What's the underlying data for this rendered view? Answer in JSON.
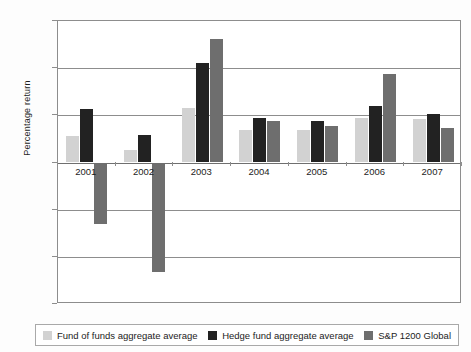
{
  "chart_data": {
    "type": "bar",
    "title": "",
    "xlabel": "",
    "ylabel": "Percentage return",
    "categories": [
      "2001",
      "2002",
      "2003",
      "2004",
      "2005",
      "2006",
      "2007"
    ],
    "series": [
      {
        "name": "Fund of funds aggregate average",
        "color": "#d2d2d2",
        "values": [
          5.7,
          2.6,
          11.5,
          6.8,
          6.8,
          9.5,
          9.2
        ]
      },
      {
        "name": "Hedge fund aggregate average",
        "color": "#222222",
        "values": [
          11.3,
          5.8,
          21.1,
          9.4,
          8.9,
          12.0,
          10.3
        ]
      },
      {
        "name": "S&P 1200 Global",
        "color": "#6e6e6e",
        "values": [
          -13.0,
          -23.3,
          26.1,
          8.8,
          7.7,
          18.7,
          7.3
        ]
      }
    ],
    "ylim": [
      -30,
      30
    ],
    "ytick_labels": [
      "30%",
      "20%",
      "10%",
      "0%",
      "−10%",
      "−20%",
      "−30%"
    ],
    "ytick_values": [
      30,
      20,
      10,
      0,
      -10,
      -20,
      -30
    ],
    "grid": true,
    "legend_position": "bottom"
  }
}
